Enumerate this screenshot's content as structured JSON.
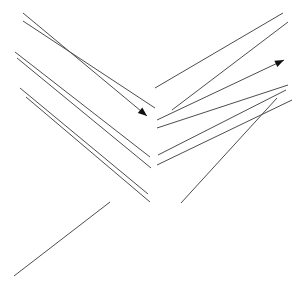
{
  "canvas": {
    "width": 297,
    "height": 290,
    "background_color": "#ffffff"
  },
  "style": {
    "line_color": "#4d4d4d",
    "line_width": 1,
    "arrowhead_color": "#111111",
    "arrowhead_length": 9,
    "arrowhead_width": 7
  },
  "diagram": {
    "lines": [
      {
        "name": "left-line-1-arrow",
        "x1": 23,
        "y1": 13,
        "x2": 147,
        "y2": 116,
        "arrow_end": true
      },
      {
        "name": "left-line-2",
        "x1": 23,
        "y1": 21,
        "x2": 155,
        "y2": 108,
        "arrow_end": false
      },
      {
        "name": "left-line-3",
        "x1": 15,
        "y1": 52,
        "x2": 150,
        "y2": 157,
        "arrow_end": false
      },
      {
        "name": "left-line-4",
        "x1": 17,
        "y1": 58,
        "x2": 151,
        "y2": 168,
        "arrow_end": false
      },
      {
        "name": "left-line-5",
        "x1": 20,
        "y1": 88,
        "x2": 148,
        "y2": 194,
        "arrow_end": false
      },
      {
        "name": "left-line-6",
        "x1": 26,
        "y1": 97,
        "x2": 150,
        "y2": 202,
        "arrow_end": false
      },
      {
        "name": "right-line-1",
        "x1": 155,
        "y1": 88,
        "x2": 283,
        "y2": 13,
        "arrow_end": false
      },
      {
        "name": "right-line-2",
        "x1": 172,
        "y1": 110,
        "x2": 288,
        "y2": 22,
        "arrow_end": false
      },
      {
        "name": "right-line-3-arrow",
        "x1": 157,
        "y1": 120,
        "x2": 284,
        "y2": 60,
        "arrow_end": true
      },
      {
        "name": "right-line-4",
        "x1": 157,
        "y1": 128,
        "x2": 288,
        "y2": 85,
        "arrow_end": false
      },
      {
        "name": "right-line-5",
        "x1": 158,
        "y1": 155,
        "x2": 286,
        "y2": 90,
        "arrow_end": false
      },
      {
        "name": "right-line-6",
        "x1": 157,
        "y1": 165,
        "x2": 292,
        "y2": 100,
        "arrow_end": false
      },
      {
        "name": "right-line-7",
        "x1": 181,
        "y1": 203,
        "x2": 277,
        "y2": 98,
        "arrow_end": false
      },
      {
        "name": "bottom-left-line",
        "x1": 14,
        "y1": 276,
        "x2": 110,
        "y2": 202,
        "arrow_end": false
      }
    ]
  }
}
